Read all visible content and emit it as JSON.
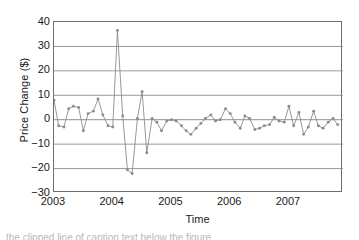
{
  "figure": {
    "background": "#ffffff",
    "line_color": "#8c8c8c",
    "marker_color": "#8c8c8c",
    "axis_color": "#6e6e6e",
    "grid_color": "#8f8f8f",
    "text_color": "#1a1a1a",
    "caption_partial": "the clipped line of caption text below the figure"
  },
  "chart_data": {
    "type": "line",
    "title": "",
    "xlabel": "Time",
    "ylabel": "Price Change ($)",
    "xlim": [
      2003.0,
      2007.92
    ],
    "ylim": [
      -30,
      40
    ],
    "yticks": [
      40,
      30,
      20,
      10,
      0,
      -10,
      -20,
      -30
    ],
    "ytick_labels": [
      "40",
      "30",
      "20",
      "10",
      "0",
      "-10",
      "-20",
      "-30"
    ],
    "xticks": [
      2003,
      2004,
      2005,
      2006,
      2007
    ],
    "xtick_labels": [
      "2003",
      "2004",
      "2005",
      "2006",
      "2007"
    ],
    "grid": "horizontal",
    "legend": "none",
    "markers": "circle",
    "series_name": "Price Change",
    "x": [
      2003.0,
      2003.08,
      2003.17,
      2003.25,
      2003.33,
      2003.42,
      2003.5,
      2003.58,
      2003.67,
      2003.75,
      2003.83,
      2003.92,
      2004.0,
      2004.08,
      2004.17,
      2004.25,
      2004.33,
      2004.42,
      2004.5,
      2004.58,
      2004.67,
      2004.75,
      2004.83,
      2004.92,
      2005.0,
      2005.08,
      2005.17,
      2005.25,
      2005.33,
      2005.42,
      2005.5,
      2005.58,
      2005.67,
      2005.75,
      2005.83,
      2005.92,
      2006.0,
      2006.08,
      2006.17,
      2006.25,
      2006.33,
      2006.42,
      2006.5,
      2006.58,
      2006.67,
      2006.75,
      2006.83,
      2006.92,
      2007.0,
      2007.08,
      2007.17,
      2007.25,
      2007.33,
      2007.42,
      2007.5,
      2007.58,
      2007.67,
      2007.75,
      2007.83
    ],
    "values": [
      8.0,
      -2.5,
      -3.0,
      4.5,
      5.5,
      5.0,
      -4.5,
      2.5,
      3.5,
      8.5,
      2.0,
      -2.5,
      -3.0,
      36.5,
      1.5,
      -20.5,
      -22.0,
      0.5,
      11.5,
      -13.5,
      0.5,
      -1.0,
      -4.5,
      -0.5,
      0.0,
      -0.5,
      -2.5,
      -4.5,
      -6.0,
      -3.5,
      -1.5,
      0.5,
      2.0,
      -0.5,
      0.0,
      4.5,
      2.5,
      -1.0,
      -3.5,
      1.5,
      0.5,
      -4.0,
      -3.5,
      -2.5,
      -2.0,
      1.0,
      -0.5,
      -1.0,
      5.5,
      -2.5,
      3.0,
      -6.0,
      -3.0,
      3.5,
      -2.5,
      -3.5,
      -1.0,
      0.5,
      -2.0
    ]
  }
}
